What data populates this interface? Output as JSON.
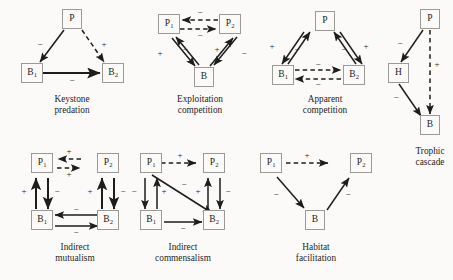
{
  "figure": {
    "background_color": "#fbfaf8",
    "box_border_color": "#9a9a96",
    "arrow_color": "#1d1d1b",
    "sign_positive": "+",
    "sign_negative": "−"
  },
  "panels": [
    {
      "id": "keystone-predation",
      "caption_line1": "Keystone",
      "caption_line2": "predation",
      "nodes": [
        {
          "id": "P",
          "label": "P",
          "sub": ""
        },
        {
          "id": "B1",
          "label": "B",
          "sub": "1"
        },
        {
          "id": "B2",
          "label": "B",
          "sub": "2"
        }
      ],
      "edges": [
        {
          "from": "P",
          "to": "B1",
          "style": "solid",
          "sign": "−"
        },
        {
          "from": "P",
          "to": "B2",
          "style": "dashed",
          "sign": "+"
        },
        {
          "from": "B1",
          "to": "B2",
          "style": "solid",
          "sign": "−"
        }
      ]
    },
    {
      "id": "exploitation-competition",
      "caption_line1": "Exploitation",
      "caption_line2": "competition",
      "nodes": [
        {
          "id": "P1",
          "label": "P",
          "sub": "1"
        },
        {
          "id": "P2",
          "label": "P",
          "sub": "2"
        },
        {
          "id": "B",
          "label": "B",
          "sub": ""
        }
      ],
      "edges": [
        {
          "from": "P2",
          "to": "P1",
          "style": "dashed",
          "sign": "−"
        },
        {
          "from": "P1",
          "to": "P2",
          "style": "dashed",
          "sign": "−"
        },
        {
          "from": "B",
          "to": "P1",
          "style": "solid",
          "sign": "+"
        },
        {
          "from": "P1",
          "to": "B",
          "style": "solid",
          "sign": "−"
        },
        {
          "from": "B",
          "to": "P2",
          "style": "solid",
          "sign": "+"
        },
        {
          "from": "P2",
          "to": "B",
          "style": "solid",
          "sign": "−"
        }
      ]
    },
    {
      "id": "apparent-competition",
      "caption_line1": "Apparent",
      "caption_line2": "competition",
      "nodes": [
        {
          "id": "P",
          "label": "P",
          "sub": ""
        },
        {
          "id": "B1",
          "label": "B",
          "sub": "1"
        },
        {
          "id": "B2",
          "label": "B",
          "sub": "2"
        }
      ],
      "edges": [
        {
          "from": "B1",
          "to": "P",
          "style": "solid",
          "sign": "+"
        },
        {
          "from": "P",
          "to": "B1",
          "style": "solid",
          "sign": "−"
        },
        {
          "from": "B2",
          "to": "P",
          "style": "solid",
          "sign": "+"
        },
        {
          "from": "P",
          "to": "B2",
          "style": "solid",
          "sign": "−"
        },
        {
          "from": "B1",
          "to": "B2",
          "style": "dashed",
          "sign": "−"
        },
        {
          "from": "B2",
          "to": "B1",
          "style": "dashed",
          "sign": "−"
        }
      ]
    },
    {
      "id": "trophic-cascade",
      "caption_line1": "Trophic",
      "caption_line2": "cascade",
      "nodes": [
        {
          "id": "P",
          "label": "P",
          "sub": ""
        },
        {
          "id": "H",
          "label": "H",
          "sub": ""
        },
        {
          "id": "B",
          "label": "B",
          "sub": ""
        }
      ],
      "edges": [
        {
          "from": "P",
          "to": "H",
          "style": "solid",
          "sign": "−"
        },
        {
          "from": "H",
          "to": "B",
          "style": "solid",
          "sign": "−"
        },
        {
          "from": "P",
          "to": "B",
          "style": "dashed",
          "sign": "+"
        }
      ]
    },
    {
      "id": "indirect-mutualism",
      "caption_line1": "Indirect",
      "caption_line2": "mutualism",
      "nodes": [
        {
          "id": "P1",
          "label": "P",
          "sub": "1"
        },
        {
          "id": "P2",
          "label": "P",
          "sub": "2"
        },
        {
          "id": "B1",
          "label": "B",
          "sub": "1"
        },
        {
          "id": "B2",
          "label": "B",
          "sub": "2"
        }
      ],
      "edges": [
        {
          "from": "P2",
          "to": "P1",
          "style": "dashed",
          "sign": "+"
        },
        {
          "from": "P1",
          "to": "P2",
          "style": "dashed",
          "sign": "+"
        },
        {
          "from": "B1",
          "to": "P1",
          "style": "solid",
          "sign": "+"
        },
        {
          "from": "P1",
          "to": "B1",
          "style": "solid",
          "sign": "−"
        },
        {
          "from": "B2",
          "to": "P2",
          "style": "solid",
          "sign": "+"
        },
        {
          "from": "P2",
          "to": "B2",
          "style": "solid",
          "sign": "−"
        },
        {
          "from": "B2",
          "to": "B1",
          "style": "solid",
          "sign": "−"
        },
        {
          "from": "B1",
          "to": "B2",
          "style": "solid",
          "sign": "−"
        }
      ]
    },
    {
      "id": "indirect-commensalism",
      "caption_line1": "Indirect",
      "caption_line2": "commensalism",
      "nodes": [
        {
          "id": "P1",
          "label": "P",
          "sub": "1"
        },
        {
          "id": "P2",
          "label": "P",
          "sub": "2"
        },
        {
          "id": "B1",
          "label": "B",
          "sub": "1"
        },
        {
          "id": "B2",
          "label": "B",
          "sub": "2"
        }
      ],
      "edges": [
        {
          "from": "P1",
          "to": "P2",
          "style": "dashed",
          "sign": "+"
        },
        {
          "from": "P1",
          "to": "B1",
          "style": "solid",
          "sign": "−"
        },
        {
          "from": "B1",
          "to": "P1",
          "style": "solid",
          "sign": "+"
        },
        {
          "from": "P1",
          "to": "B2",
          "style": "solid",
          "sign": "−"
        },
        {
          "from": "B2",
          "to": "P2",
          "style": "solid",
          "sign": "+"
        },
        {
          "from": "P2",
          "to": "B2",
          "style": "solid",
          "sign": "−"
        },
        {
          "from": "B1",
          "to": "B2",
          "style": "solid",
          "sign": "−"
        }
      ]
    },
    {
      "id": "habitat-facilitation",
      "caption_line1": "Habitat",
      "caption_line2": "facilitation",
      "nodes": [
        {
          "id": "P1",
          "label": "P",
          "sub": "1"
        },
        {
          "id": "P2",
          "label": "P",
          "sub": "2"
        },
        {
          "id": "B",
          "label": "B",
          "sub": ""
        }
      ],
      "edges": [
        {
          "from": "P1",
          "to": "P2",
          "style": "dashed",
          "sign": "+"
        },
        {
          "from": "P1",
          "to": "B",
          "style": "solid",
          "sign": "−"
        },
        {
          "from": "B",
          "to": "P2",
          "style": "solid",
          "sign": "−"
        }
      ]
    }
  ]
}
